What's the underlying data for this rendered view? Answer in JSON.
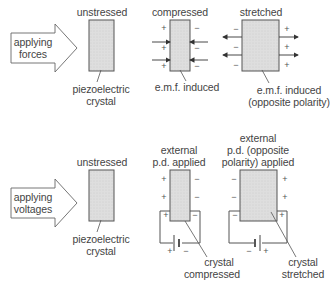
{
  "top_section": {
    "arrow_label_line1": "applying",
    "arrow_label_line2": "forces",
    "unstressed_label": "unstressed",
    "crystal_label_line1": "piezoelectric",
    "crystal_label_line2": "crystal",
    "compressed_label": "compressed",
    "compressed_caption": "e.m.f. induced",
    "stretched_label": "stretched",
    "stretched_caption_line1": "e.m.f. induced",
    "stretched_caption_line2": "(opposite polarity)",
    "plus": "+",
    "minus": "−"
  },
  "bottom_section": {
    "arrow_label_line1": "applying",
    "arrow_label_line2": "voltages",
    "unstressed_label": "unstressed",
    "crystal_label_line1": "piezoelectric",
    "crystal_label_line2": "crystal",
    "external_label_line1": "external",
    "external_label_line2": "p.d. applied",
    "opposite_label_line1": "external",
    "opposite_label_line2": "p.d. (opposite",
    "opposite_label_line3": "polarity) applied",
    "compressed_caption_line1": "crystal",
    "compressed_caption_line2": "compressed",
    "stretched_caption_line1": "crystal",
    "stretched_caption_line2": "stretched",
    "plus": "+",
    "minus": "−"
  },
  "colors": {
    "crystal_fill": "#dcdcdc",
    "stroke": "#555555",
    "text": "#444444"
  }
}
